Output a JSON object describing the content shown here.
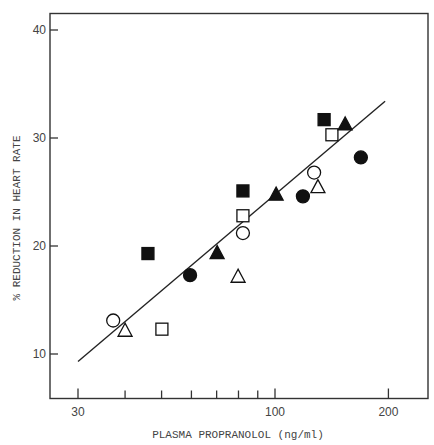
{
  "chart_data": {
    "type": "scatter",
    "title": "",
    "xlabel": "PLASMA PROPRANOLOL (ng/ml)",
    "ylabel": "% REDUCTION IN HEART RATE",
    "xscale": "log",
    "xlim": [
      27,
      230
    ],
    "ylim": [
      6.1,
      41.5
    ],
    "x_ticks": [
      30,
      40,
      50,
      60,
      70,
      80,
      90,
      100,
      200
    ],
    "x_tick_labels": [
      "30",
      "",
      "",
      "",
      "",
      "",
      "",
      "100",
      "200"
    ],
    "y_ticks": [
      10,
      20,
      30,
      40
    ],
    "y_tick_labels": [
      "10",
      "20",
      "30",
      "40"
    ],
    "grid": false,
    "legend": null,
    "series": [
      {
        "name": "filled circle",
        "marker": "circle",
        "filled": true,
        "points": [
          [
            59.5,
            17.3
          ],
          [
            118.6,
            24.6
          ],
          [
            169,
            28.2
          ]
        ]
      },
      {
        "name": "open circle",
        "marker": "circle",
        "filled": false,
        "points": [
          [
            37.2,
            13.1
          ],
          [
            82.2,
            21.2
          ],
          [
            127,
            26.8
          ]
        ]
      },
      {
        "name": "filled square",
        "marker": "square",
        "filled": true,
        "points": [
          [
            46,
            19.3
          ],
          [
            82.2,
            25.1
          ],
          [
            135,
            31.7
          ]
        ]
      },
      {
        "name": "open square",
        "marker": "square",
        "filled": false,
        "points": [
          [
            50.1,
            12.3
          ],
          [
            82.2,
            22.8
          ],
          [
            141.6,
            30.3
          ]
        ]
      },
      {
        "name": "filled triangle",
        "marker": "triangle",
        "filled": true,
        "points": [
          [
            70.2,
            19.4
          ],
          [
            100.7,
            24.8
          ],
          [
            153.5,
            31.3
          ]
        ]
      },
      {
        "name": "open triangle",
        "marker": "triangle",
        "filled": false,
        "points": [
          [
            40,
            12.2
          ],
          [
            79.8,
            17.2
          ],
          [
            130,
            25.5
          ]
        ]
      }
    ],
    "regression_line": {
      "x": [
        30,
        196
      ],
      "y": [
        9.3,
        33.4
      ]
    }
  },
  "labels": {
    "xlabel": "PLASMA PROPRANOLOL (ng/ml)",
    "ylabel": "% REDUCTION IN HEART RATE"
  }
}
